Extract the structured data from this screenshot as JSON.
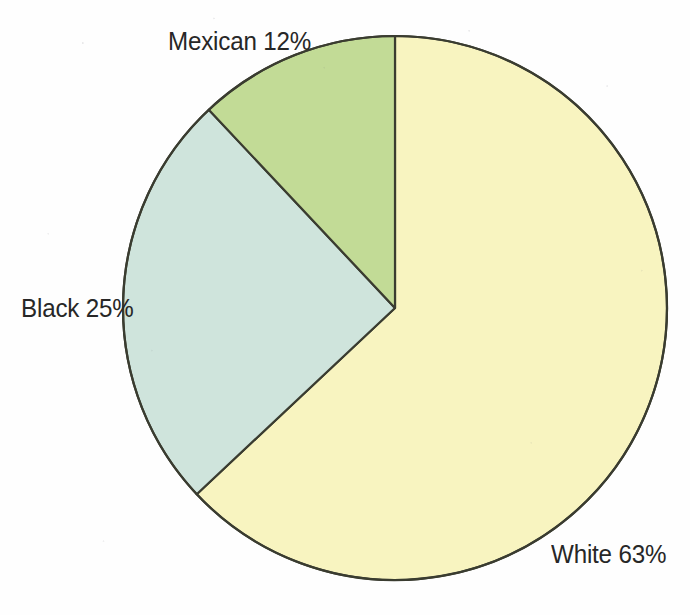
{
  "chart_data": {
    "type": "pie",
    "title": "",
    "subtitle": "",
    "xlabel": "",
    "ylabel": "",
    "legend_position": "none",
    "grid": false,
    "labels_inline": true,
    "start_angle_deg": 0,
    "direction": "clockwise",
    "categories": [
      "White",
      "Black",
      "Mexican"
    ],
    "values": [
      63,
      25,
      12
    ],
    "unit": "%",
    "slices": [
      {
        "name": "White",
        "label": "White 63%",
        "value": 63,
        "unit": "%",
        "color": "#f8f4c0",
        "start_deg": 0,
        "end_deg": 226.8,
        "label_position": "bottom-right-outside"
      },
      {
        "name": "Black",
        "label": "Black 25%",
        "value": 25,
        "unit": "%",
        "color": "#cfe4dc",
        "start_deg": 226.8,
        "end_deg": 316.8,
        "label_position": "left-outside"
      },
      {
        "name": "Mexican",
        "label": "Mexican 12%",
        "value": 12,
        "unit": "%",
        "color": "#c2db96",
        "start_deg": 316.8,
        "end_deg": 360,
        "label_position": "top-outside"
      }
    ]
  },
  "geometry": {
    "center_x": 395,
    "center_y": 308,
    "radius": 272,
    "stroke_color": "#3a3c30",
    "stroke_width": 2.2
  },
  "canvas": {
    "width": 690,
    "height": 615,
    "background": "#fefefe",
    "text_color": "#272727"
  }
}
